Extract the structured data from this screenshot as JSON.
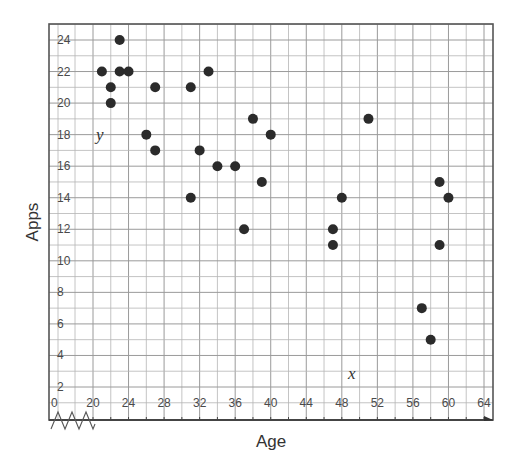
{
  "chart_data": {
    "type": "scatter",
    "title": "",
    "xlabel": "Age",
    "ylabel": "Apps",
    "x_variable": "x",
    "y_variable": "y",
    "xlim": [
      20,
      64
    ],
    "ylim": [
      0,
      25
    ],
    "x_axis_break": true,
    "x_origin_label": "0",
    "xticks": [
      20,
      24,
      28,
      32,
      36,
      40,
      44,
      48,
      52,
      56,
      60,
      64
    ],
    "yticks": [
      2,
      4,
      6,
      8,
      10,
      12,
      14,
      16,
      18,
      20,
      22,
      24
    ],
    "grid": true,
    "grid_minor_x_step": 2,
    "grid_minor_y_step": 1,
    "legend": null,
    "colors": {
      "points": "#2b2b2b",
      "grid": "#b5b5b5",
      "frame": "#555555"
    },
    "points": [
      {
        "x": 21,
        "y": 22
      },
      {
        "x": 22,
        "y": 21
      },
      {
        "x": 22,
        "y": 20
      },
      {
        "x": 23,
        "y": 24
      },
      {
        "x": 23,
        "y": 22
      },
      {
        "x": 24,
        "y": 22
      },
      {
        "x": 26,
        "y": 18
      },
      {
        "x": 27,
        "y": 21
      },
      {
        "x": 27,
        "y": 17
      },
      {
        "x": 31,
        "y": 21
      },
      {
        "x": 31,
        "y": 14
      },
      {
        "x": 32,
        "y": 17
      },
      {
        "x": 33,
        "y": 22
      },
      {
        "x": 34,
        "y": 16
      },
      {
        "x": 36,
        "y": 16
      },
      {
        "x": 37,
        "y": 12
      },
      {
        "x": 38,
        "y": 19
      },
      {
        "x": 39,
        "y": 15
      },
      {
        "x": 40,
        "y": 18
      },
      {
        "x": 47,
        "y": 12
      },
      {
        "x": 47,
        "y": 11
      },
      {
        "x": 48,
        "y": 14
      },
      {
        "x": 51,
        "y": 19
      },
      {
        "x": 57,
        "y": 7
      },
      {
        "x": 58,
        "y": 5
      },
      {
        "x": 59,
        "y": 15
      },
      {
        "x": 59,
        "y": 11
      },
      {
        "x": 60,
        "y": 14
      }
    ]
  }
}
